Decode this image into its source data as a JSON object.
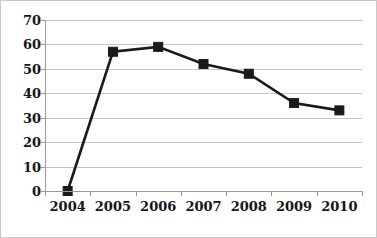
{
  "chart_data": {
    "type": "line",
    "title": "",
    "xlabel": "",
    "ylabel": "",
    "categories": [
      "2004",
      "2005",
      "2006",
      "2007",
      "2008",
      "2009",
      "2010"
    ],
    "values": [
      0,
      57,
      59,
      52,
      48,
      36,
      33
    ],
    "series": [
      {
        "name": "",
        "values": [
          0,
          57,
          59,
          52,
          48,
          36,
          33
        ]
      }
    ],
    "ylim": [
      0,
      70
    ],
    "yticks": [
      0,
      10,
      20,
      30,
      40,
      50,
      60,
      70
    ],
    "ytick_labels": [
      "0",
      "10",
      "20",
      "30",
      "40",
      "50",
      "60",
      "70"
    ],
    "xtick_labels": [
      "2004",
      "2005",
      "2006",
      "2007",
      "2008",
      "2009",
      "2010"
    ],
    "grid": "horizontal",
    "legend": "none",
    "marker": "square",
    "colors": {
      "line": "#1a1a1a",
      "marker": "#1a1a1a",
      "gridline": "#c6c6c6",
      "axis": "#9a9a9a",
      "border": "#c9c9c9",
      "background": "#ffffff",
      "text": "#161616"
    }
  }
}
